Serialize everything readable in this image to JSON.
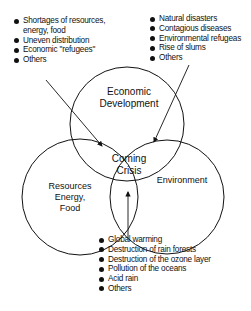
{
  "diagram": {
    "circles": [
      {
        "id": "economic",
        "label_lines": [
          "Economic",
          "Development"
        ]
      },
      {
        "id": "resources",
        "label_lines": [
          "Resources",
          "Energy,",
          "Food"
        ]
      },
      {
        "id": "environment",
        "label_lines": [
          "Environment"
        ]
      }
    ],
    "center_label_lines": [
      "Coming",
      "Crisis"
    ],
    "lists": {
      "resources_list": [
        {
          "text": "Shortages of resources,"
        },
        {
          "text": "energy, food",
          "continuation": true
        },
        {
          "text": "Uneven distribution"
        },
        {
          "text": "Economic \"refugees\""
        },
        {
          "text": "Others"
        }
      ],
      "social_list": [
        {
          "text": "Natural disasters"
        },
        {
          "text": "Contagious diseases"
        },
        {
          "text": "Environmental refugeas"
        },
        {
          "text": "Rise of slums"
        },
        {
          "text": "Others"
        }
      ],
      "environment_list": [
        {
          "text": "Global warming"
        },
        {
          "text": "Destruction of rain forests"
        },
        {
          "text": "Destruction of the ozone layer"
        },
        {
          "text": "Pollution of the oceans"
        },
        {
          "text": "Acid rain"
        },
        {
          "text": "Others"
        }
      ]
    }
  }
}
